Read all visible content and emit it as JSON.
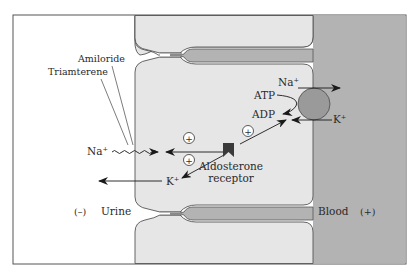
{
  "diagram": {
    "drugs": {
      "amiloride": "Amiloride",
      "triamterene": "Triamterene"
    },
    "ions": {
      "na_lumen": "Na⁺",
      "k_lumen": "K⁺",
      "na_pump": "Na⁺",
      "k_pump": "K⁺"
    },
    "energy": {
      "atp": "ATP",
      "adp": "ADP"
    },
    "receptor": {
      "line1": "Aldosterone",
      "line2": "receptor"
    },
    "stimulation_sign": "+",
    "compartments": {
      "urine": "Urine",
      "urine_charge": "(–)",
      "blood": "Blood",
      "blood_charge": "(+)"
    },
    "colors": {
      "background": "#ffffff",
      "lumen": "#ffffff",
      "cell": "#e6e6e6",
      "blood": "#b3b3b3",
      "pump": "#9a9a9a",
      "receptor": "#3a3a3a",
      "outline": "#555555"
    }
  }
}
